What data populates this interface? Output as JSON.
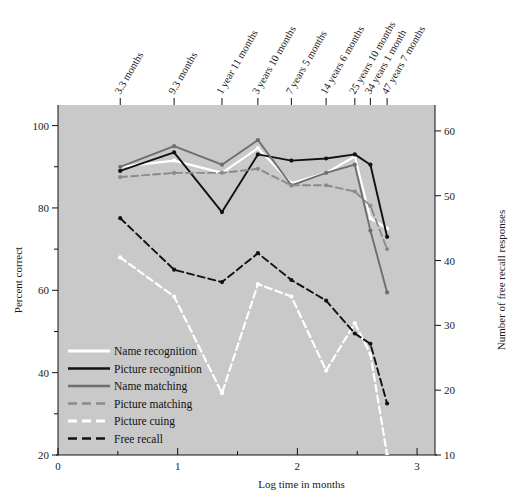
{
  "figure": {
    "background": "#ffffff",
    "plot_background": "#c9c9c9",
    "xlabel": "Log time in months",
    "ylabel_left": "Percent correct",
    "ylabel_right": "Number of free recall responses",
    "caption": ""
  },
  "chart_data": {
    "type": "line",
    "title": "",
    "xlabel": "Log time in months",
    "ylabel": "Percent correct",
    "ylabel_secondary": "Number of free recall responses",
    "xlim": [
      0,
      3.15
    ],
    "ylim": [
      20,
      105
    ],
    "ylim_secondary": [
      10,
      64
    ],
    "grid": false,
    "legend_position": "lower-left-inside",
    "xticks": [
      0,
      1,
      2,
      3
    ],
    "xtick_labels": [
      "0",
      "1",
      "2",
      "3"
    ],
    "xticks_minor": [
      0.5,
      1.5,
      2.5
    ],
    "yticks": [
      20,
      40,
      60,
      80,
      100
    ],
    "ytick_labels": [
      "20",
      "40",
      "60",
      "80",
      "100"
    ],
    "yticks_minor": [
      30,
      50,
      70,
      90
    ],
    "yticks_secondary": [
      10,
      20,
      30,
      40,
      50,
      60
    ],
    "ytick_labels_secondary": [
      "10",
      "20",
      "30",
      "40",
      "50",
      "60"
    ],
    "top_axis_labels": [
      {
        "x": 0.52,
        "text": "3.3 months"
      },
      {
        "x": 0.97,
        "text": "9.3 months"
      },
      {
        "x": 1.37,
        "text": "1 year 11 months"
      },
      {
        "x": 1.67,
        "text": "3 years 10 months"
      },
      {
        "x": 1.95,
        "text": "7 years 5 months"
      },
      {
        "x": 2.24,
        "text": "14 years 6 months"
      },
      {
        "x": 2.48,
        "text": "25 years 10 months"
      },
      {
        "x": 2.61,
        "text": "34 years 1 month"
      },
      {
        "x": 2.75,
        "text": "47 years 7 months"
      }
    ],
    "x": [
      0.52,
      0.97,
      1.37,
      1.67,
      1.95,
      2.24,
      2.48,
      2.61,
      2.75
    ],
    "series": [
      {
        "name": "Name recognition",
        "color": "#ffffff",
        "style": "solid",
        "marker": "dot",
        "values": [
          90.0,
          91.5,
          88.5,
          94.5,
          86.0,
          88.5,
          92.5,
          77.5,
          75.0
        ]
      },
      {
        "name": "Picture recognition",
        "color": "#111111",
        "style": "solid",
        "marker": "dot",
        "values": [
          89.0,
          93.5,
          79.0,
          93.0,
          91.5,
          92.0,
          93.0,
          90.5,
          73.0
        ]
      },
      {
        "name": "Name matching",
        "color": "#6e6e6e",
        "style": "solid",
        "marker": "dot",
        "values": [
          90.0,
          95.0,
          90.5,
          96.5,
          85.5,
          88.5,
          90.5,
          74.5,
          59.5
        ]
      },
      {
        "name": "Picture matching",
        "color": "#8a8a8a",
        "style": "dashed",
        "marker": "dot",
        "values": [
          87.5,
          88.5,
          88.5,
          89.5,
          85.5,
          85.5,
          84.0,
          80.5,
          70.0
        ]
      },
      {
        "name": "Picture cuing",
        "color": "#ffffff",
        "style": "dashed",
        "marker": "dot",
        "values": [
          68.0,
          58.5,
          35.0,
          61.5,
          58.5,
          40.5,
          52.0,
          44.5,
          20.0
        ]
      },
      {
        "name": "Free recall",
        "color": "#111111",
        "style": "dashed",
        "marker": "dot",
        "values": [
          77.5,
          65.0,
          62.0,
          69.0,
          62.5,
          57.5,
          49.5,
          47.0,
          32.5
        ]
      }
    ],
    "legend": [
      {
        "label": "Name recognition",
        "color": "#ffffff",
        "style": "solid"
      },
      {
        "label": "Picture recognition",
        "color": "#111111",
        "style": "solid"
      },
      {
        "label": "Name matching",
        "color": "#6e6e6e",
        "style": "solid"
      },
      {
        "label": "Picture matching",
        "color": "#8a8a8a",
        "style": "dashed"
      },
      {
        "label": "Picture cuing",
        "color": "#ffffff",
        "style": "dashed"
      },
      {
        "label": "Free recall",
        "color": "#111111",
        "style": "dashed"
      }
    ]
  }
}
